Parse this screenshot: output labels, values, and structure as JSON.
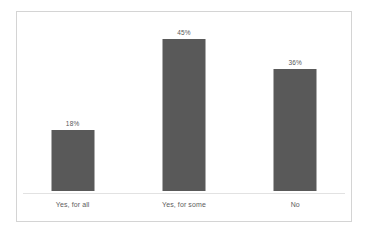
{
  "chart_data": {
    "type": "bar",
    "title": "",
    "subtitle": "",
    "xlabel": "",
    "ylabel": "",
    "categories": [
      "Yes, for all",
      "Yes, for some",
      "No"
    ],
    "values": [
      18,
      45,
      36
    ],
    "data_labels": [
      "18%",
      "45%",
      "36%"
    ],
    "ylim": [
      0,
      50
    ],
    "grid": false,
    "legend": false,
    "legend_position": "none",
    "orientation": "vertical",
    "series": [
      {
        "name": "",
        "values": [
          18,
          45,
          36
        ]
      }
    ]
  },
  "style": {
    "bar_color": "#595959",
    "label_color": "#575757",
    "category_color": "#5d5d5d",
    "axis_color": "#e2e2e2",
    "frame_color": "#d4d4d4",
    "background": "#ffffff"
  }
}
